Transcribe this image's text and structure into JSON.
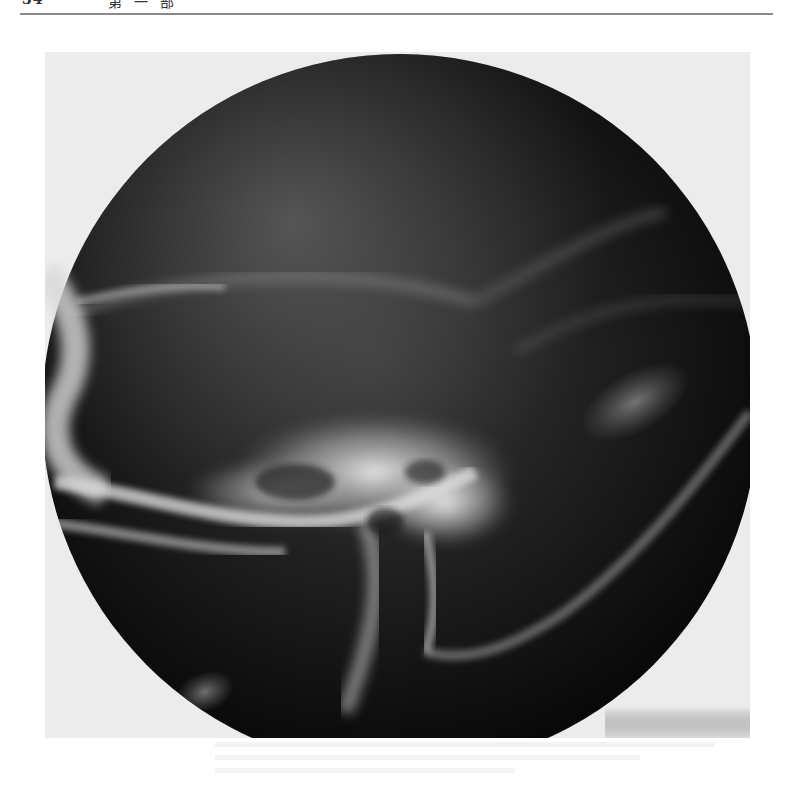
{
  "page": {
    "running_head": {
      "page_number": "34",
      "section": "第一部"
    }
  },
  "figure": {
    "type": "radiograph",
    "colors": {
      "background_film": "#ececec",
      "field_dark": "#0b0b0b",
      "bone_bright": "#e6e6e6"
    }
  }
}
